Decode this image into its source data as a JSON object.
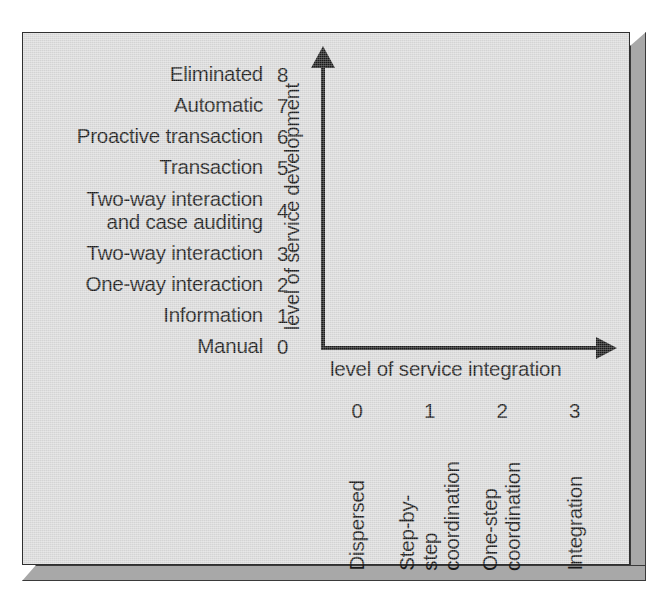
{
  "figure": {
    "y_axis": {
      "title": "level of service development",
      "arrow_icon": "arrow-up-icon",
      "levels": [
        {
          "value": "8",
          "label": "Eliminated"
        },
        {
          "value": "7",
          "label": "Automatic"
        },
        {
          "value": "6",
          "label": "Proactive transaction"
        },
        {
          "value": "5",
          "label": "Transaction"
        },
        {
          "value": "4",
          "label": "Two-way interaction\nand case auditing"
        },
        {
          "value": "3",
          "label": "Two-way interaction"
        },
        {
          "value": "2",
          "label": "One-way interaction"
        },
        {
          "value": "1",
          "label": "Information"
        },
        {
          "value": "0",
          "label": "Manual"
        }
      ]
    },
    "x_axis": {
      "title": "level of service integration",
      "arrow_icon": "arrow-right-icon",
      "levels": [
        {
          "value": "0",
          "label": "Dispersed"
        },
        {
          "value": "1",
          "label": "Step-by-step\ncoordination"
        },
        {
          "value": "2",
          "label": "One-step\ncoordination"
        },
        {
          "value": "3",
          "label": "Integration"
        }
      ]
    },
    "colors": {
      "panel_background": "#dcdcdc",
      "panel_border": "#2f2f2f",
      "panel_bevel": "#a8a8a8",
      "ink": "#1b1b1b",
      "page_background": "#ffffff"
    }
  }
}
